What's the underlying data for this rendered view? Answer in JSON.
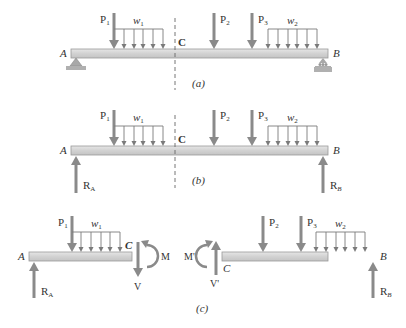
{
  "colors": {
    "arrow": "#8a8a8a",
    "beam_fill": "#d4d4d4",
    "beam_stroke": "#9a9a9a",
    "load_line": "#7a7a7a",
    "text": "#333333",
    "support": "#a8a8a8"
  },
  "panels": {
    "a": {
      "caption": "(a)",
      "end_left": "A",
      "end_right": "B",
      "section": "C",
      "loads": {
        "p1": {
          "sym": "P",
          "sub": "1"
        },
        "w1": {
          "sym": "w",
          "sub": "1"
        },
        "p2": {
          "sym": "P",
          "sub": "2"
        },
        "p3": {
          "sym": "P",
          "sub": "3"
        },
        "w2": {
          "sym": "w",
          "sub": "2"
        }
      },
      "supports": [
        "pin-support at A",
        "roller-support at B"
      ]
    },
    "b": {
      "caption": "(b)",
      "end_left": "A",
      "end_right": "B",
      "section": "C",
      "loads": {
        "p1": {
          "sym": "P",
          "sub": "1"
        },
        "w1": {
          "sym": "w",
          "sub": "1"
        },
        "p2": {
          "sym": "P",
          "sub": "2"
        },
        "p3": {
          "sym": "P",
          "sub": "3"
        },
        "w2": {
          "sym": "w",
          "sub": "2"
        }
      },
      "reactions": {
        "ra": {
          "sym": "R",
          "sub": "A"
        },
        "rb": {
          "sym": "R",
          "sub": "B"
        }
      }
    },
    "c": {
      "caption": "(c)",
      "left": {
        "end": "A",
        "section": "C",
        "p1": {
          "sym": "P",
          "sub": "1"
        },
        "w1": {
          "sym": "w",
          "sub": "1"
        },
        "ra": {
          "sym": "R",
          "sub": "A"
        },
        "moment": "M",
        "shear": "V"
      },
      "right": {
        "end": "B",
        "section": "C",
        "p2": {
          "sym": "P",
          "sub": "2"
        },
        "p3": {
          "sym": "P",
          "sub": "3"
        },
        "w2": {
          "sym": "w",
          "sub": "2"
        },
        "rb": {
          "sym": "R",
          "sub": "B"
        },
        "moment": "M'",
        "shear": "V'"
      }
    }
  }
}
